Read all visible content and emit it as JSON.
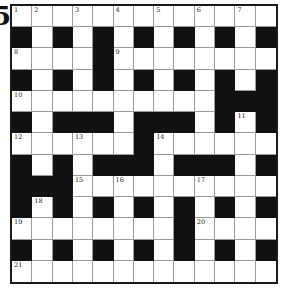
{
  "edge_glyph": "5",
  "puzzle": {
    "rows": 13,
    "cols": 13,
    "colors": {
      "black": "#111111",
      "white": "#ffffff",
      "border": "#1a1a1a",
      "gridline": "#9a9a9a"
    },
    "layout": [
      ".............",
      "#.#.#.#.#.#.#",
      "....#........",
      "#.#.#.#.#.#.#",
      "..........###",
      "#.###.###.#.#",
      "......#......",
      "#.#.###.###.#",
      "###..........",
      "#.#.#.#.#.#.#",
      "........#....",
      "#.#.#.#.#.#.#",
      "............."
    ],
    "numbers": [
      {
        "r": 0,
        "c": 0,
        "n": "1"
      },
      {
        "r": 0,
        "c": 1,
        "n": "2"
      },
      {
        "r": 0,
        "c": 3,
        "n": "3"
      },
      {
        "r": 0,
        "c": 5,
        "n": "4"
      },
      {
        "r": 0,
        "c": 7,
        "n": "5"
      },
      {
        "r": 0,
        "c": 9,
        "n": "6"
      },
      {
        "r": 0,
        "c": 11,
        "n": "7"
      },
      {
        "r": 2,
        "c": 0,
        "n": "8"
      },
      {
        "r": 2,
        "c": 5,
        "n": "9"
      },
      {
        "r": 4,
        "c": 0,
        "n": "10"
      },
      {
        "r": 5,
        "c": 11,
        "n": "11"
      },
      {
        "r": 6,
        "c": 0,
        "n": "12"
      },
      {
        "r": 6,
        "c": 3,
        "n": "13"
      },
      {
        "r": 6,
        "c": 7,
        "n": "14"
      },
      {
        "r": 8,
        "c": 3,
        "n": "15"
      },
      {
        "r": 8,
        "c": 5,
        "n": "16"
      },
      {
        "r": 8,
        "c": 9,
        "n": "17"
      },
      {
        "r": 9,
        "c": 1,
        "n": "18"
      },
      {
        "r": 10,
        "c": 0,
        "n": "19"
      },
      {
        "r": 10,
        "c": 9,
        "n": "20"
      },
      {
        "r": 12,
        "c": 0,
        "n": "21"
      }
    ]
  }
}
